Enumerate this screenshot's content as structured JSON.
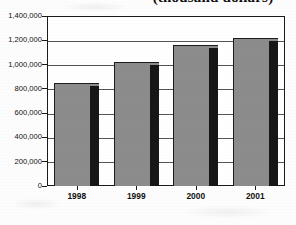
{
  "chart_data": {
    "type": "bar",
    "title": "(thousand dollars)",
    "xlabel": "",
    "ylabel": "",
    "categories": [
      "1998",
      "1999",
      "2000",
      "2001"
    ],
    "values": [
      850000,
      1020000,
      1165000,
      1215000
    ],
    "ylim": [
      0,
      1400000
    ],
    "y_ticks": [
      0,
      200000,
      400000,
      600000,
      800000,
      1000000,
      1200000,
      1400000
    ],
    "y_tick_labels": [
      "0",
      "200,000",
      "400,000",
      "600,000",
      "800,000",
      "1,000,000",
      "1,200,000",
      "1,400,000"
    ],
    "grid": true,
    "legend": false,
    "legend_position": "none",
    "series": [
      {
        "name": "Value",
        "values": [
          850000,
          1020000,
          1165000,
          1215000
        ]
      }
    ],
    "colors": {
      "bar_fill": "#8c8c8c",
      "bar_shadow": "#171717",
      "bar_outline": "#1c1c1c",
      "gridline": "#555555",
      "frame": "#1a1a1a",
      "background": "#ffffff",
      "text": "#111111"
    },
    "annotations": []
  }
}
